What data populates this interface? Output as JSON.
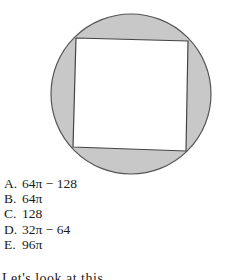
{
  "figure": {
    "circle": {
      "cx": 131,
      "cy": 94,
      "r": 80,
      "fill": "#c8c8c8",
      "stroke": "#555555"
    },
    "square": {
      "points": "76,38 188,41 186,151 73,147",
      "fill": "#ffffff",
      "stroke": "#444444"
    }
  },
  "choices": [
    {
      "letter": "A.",
      "value": "64π − 128"
    },
    {
      "letter": "B.",
      "value": "64π"
    },
    {
      "letter": "C.",
      "value": "128"
    },
    {
      "letter": "D.",
      "value": "32π − 64"
    },
    {
      "letter": "E.",
      "value": "96π"
    }
  ],
  "cutoff_text": "Let's look at this..."
}
